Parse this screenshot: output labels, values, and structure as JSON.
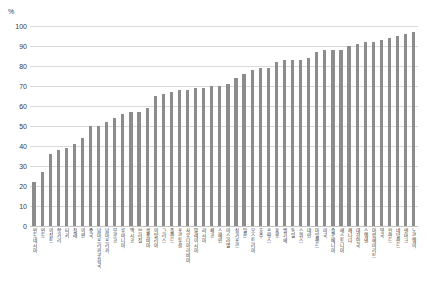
{
  "chart_data": {
    "type": "bar",
    "title": "",
    "subtitle": "",
    "xlabel": "",
    "ylabel": "",
    "unit_label": "%",
    "ylim": [
      0,
      100
    ],
    "yticks": [
      0,
      10,
      20,
      30,
      40,
      50,
      60,
      70,
      80,
      90,
      100
    ],
    "grid": true,
    "legend": false,
    "legend_position": "none",
    "bar_color": "#8c8c8c",
    "gridline_color": "#d9d9d9",
    "categories": [
      "인도네시아",
      "인도",
      "이집트",
      "헝가리",
      "터키",
      "칠레",
      "이란",
      "중국",
      "남아프리카공화국",
      "남아프리카",
      "모로코",
      "루마니아",
      "멕시코",
      "브라질",
      "콜롬비아",
      "이탈리아",
      "그리스",
      "폴란드",
      "포르투갈",
      "사우디아라비아",
      "말레이시아",
      "러시아",
      "체코",
      "스페인",
      "이스라엘",
      "싱가포르",
      "일본",
      "오스트리아",
      "호주",
      "프랑스",
      "홍콩",
      "벨기에",
      "독일",
      "스위스",
      "대만",
      "아일랜드",
      "미국",
      "슬로베니아",
      "에스토니아",
      "캐나다",
      "대한민국",
      "스웨덴",
      "아랍에미리트",
      "영국",
      "핀란드",
      "네덜란드",
      "덴마크",
      "노르웨이"
    ],
    "values": [
      22,
      27,
      36,
      38,
      39,
      41,
      44,
      50,
      50,
      52,
      54,
      56,
      57,
      57,
      59,
      65,
      66,
      67,
      68,
      68,
      69,
      69,
      70,
      70,
      71,
      74,
      76,
      78,
      79,
      79,
      82,
      83,
      83,
      83,
      84,
      87,
      88,
      88,
      88,
      90,
      91,
      92,
      92,
      93,
      94,
      95,
      96,
      97
    ]
  }
}
